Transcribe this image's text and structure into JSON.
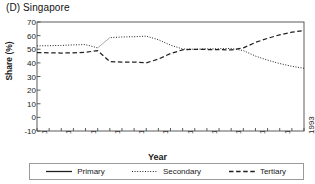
{
  "figure": {
    "panel_title": "(D) Singapore",
    "xlabel": "Year",
    "ylabel": "Share (%)"
  },
  "legend": {
    "position": "below-axes",
    "items": [
      {
        "label": "Primary",
        "style": "solid",
        "color": "#202020",
        "icon": "solid-line-icon"
      },
      {
        "label": "Secondary",
        "style": "dotted",
        "color": "#202020",
        "icon": "dotted-line-icon"
      },
      {
        "label": "Tertiary",
        "style": "dashed",
        "color": "#202020",
        "icon": "dashed-line-icon"
      }
    ]
  },
  "axes": {
    "y_ticks": [
      "70",
      "60",
      "50",
      "40",
      "30",
      "20",
      "10",
      "0",
      "-10"
    ],
    "x_ticks": [
      "1971",
      "1973",
      "1975",
      "1977",
      "1979",
      "1981",
      "1983",
      "1985",
      "1987",
      "1989",
      "1991",
      "1993"
    ]
  },
  "chart_data": {
    "type": "line",
    "title": "(D) Singapore",
    "xlabel": "Year",
    "ylabel": "Share (%)",
    "xlim": [
      1971,
      1993
    ],
    "ylim": [
      -10,
      70
    ],
    "ytick_step": 10,
    "xtick_step": 2,
    "minor_xticks": 1,
    "grid": false,
    "legend_position": "below",
    "x": [
      1971,
      1972,
      1973,
      1974,
      1975,
      1976,
      1977,
      1978,
      1979,
      1980,
      1981,
      1982,
      1983,
      1984,
      1985,
      1986,
      1987,
      1988,
      1989,
      1990,
      1991,
      1992,
      1993
    ],
    "series": [
      {
        "name": "Primary",
        "style": "solid",
        "color": "#202020",
        "values": [
          null,
          null,
          null,
          null,
          null,
          null,
          null,
          null,
          null,
          null,
          null,
          null,
          null,
          null,
          null,
          null,
          null,
          null,
          null,
          null,
          null,
          null,
          null
        ],
        "note": "not visible in plot area"
      },
      {
        "name": "Secondary",
        "style": "dotted",
        "color": "#202020",
        "values": [
          52.5,
          52.6,
          52.8,
          53.2,
          53.4,
          51.0,
          58.5,
          59.0,
          59.2,
          59.6,
          57.0,
          53.0,
          50.2,
          50.0,
          50.3,
          50.4,
          50.6,
          49.0,
          45.0,
          42.0,
          39.5,
          37.5,
          36.0
        ]
      },
      {
        "name": "Tertiary",
        "style": "dashed",
        "color": "#202020",
        "values": [
          47.5,
          47.4,
          47.2,
          47.4,
          47.8,
          49.0,
          41.0,
          40.5,
          40.6,
          40.0,
          42.8,
          46.8,
          49.6,
          50.0,
          49.8,
          49.7,
          49.5,
          51.0,
          55.0,
          58.0,
          60.6,
          62.5,
          63.8
        ]
      }
    ]
  }
}
